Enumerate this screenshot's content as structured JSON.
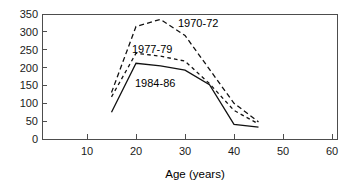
{
  "chart_data": {
    "type": "line",
    "title": "",
    "xlabel": "Age (years)",
    "ylabel": "",
    "xlim": [
      5,
      60
    ],
    "ylim": [
      0,
      350
    ],
    "grid": false,
    "legend_position": "inline-annotations",
    "x_ticks": [
      10,
      20,
      30,
      40,
      50,
      60
    ],
    "x_tick_labels": [
      "10",
      "20",
      "30",
      "40",
      "50",
      "60"
    ],
    "y_ticks": [
      0,
      50,
      100,
      150,
      200,
      250,
      300,
      350
    ],
    "y_tick_labels": [
      "0",
      "50",
      "100",
      "150",
      "200",
      "250",
      "300",
      "350"
    ],
    "series": [
      {
        "name": "1970-72",
        "style": "long-dashed",
        "label": "1970-72",
        "x": [
          15,
          20,
          25,
          30,
          35,
          40,
          45
        ],
        "values": [
          130,
          315,
          335,
          290,
          195,
          100,
          48
        ]
      },
      {
        "name": "1977-79",
        "style": "short-dashed",
        "label": "1977-79",
        "x": [
          15,
          20,
          25,
          30,
          35,
          40,
          45
        ],
        "values": [
          118,
          240,
          232,
          218,
          155,
          80,
          42
        ]
      },
      {
        "name": "1984-86",
        "style": "solid",
        "label": "1984-86",
        "x": [
          15,
          20,
          25,
          30,
          35,
          40,
          45
        ],
        "values": [
          75,
          212,
          205,
          193,
          152,
          41,
          33
        ]
      }
    ],
    "annotations": [
      {
        "text": "1970-72",
        "x": 178,
        "y": 27,
        "for": "1970-72"
      },
      {
        "text": "1977-79",
        "x": 132,
        "y": 53,
        "for": "1977-79"
      },
      {
        "text": "1984-86",
        "x": 135,
        "y": 87,
        "for": "1984-86"
      }
    ]
  },
  "axes": {
    "x_title": "Age (years)"
  }
}
